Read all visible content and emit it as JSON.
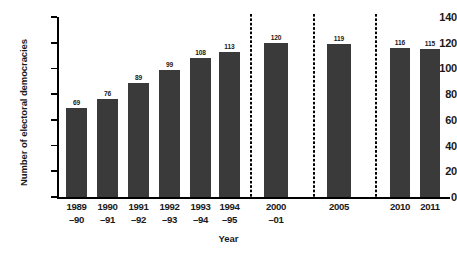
{
  "chart_data": {
    "type": "bar",
    "title": "",
    "xlabel": "Year",
    "ylabel": "Number of electoral democracies",
    "ylim": [
      0,
      140
    ],
    "ytick_step": 20,
    "yticks": [
      0,
      20,
      40,
      60,
      80,
      100,
      120,
      140
    ],
    "grid": false,
    "legend": false,
    "bar_color": "#3a3a3a",
    "axis_color": "#000000",
    "background_color": "#ffffff",
    "categories": [
      "1989–90",
      "1990–91",
      "1991–92",
      "1992–93",
      "1993–94",
      "1994–95",
      "2000–01",
      "2005",
      "2010",
      "2011"
    ],
    "category_lines": [
      [
        "1989",
        "–90"
      ],
      [
        "1990",
        "–91"
      ],
      [
        "1991",
        "–92"
      ],
      [
        "1992",
        "–93"
      ],
      [
        "1993",
        "–94"
      ],
      [
        "1994",
        "–95"
      ],
      [
        "2000",
        "–01"
      ],
      [
        "2005",
        ""
      ],
      [
        "2010",
        ""
      ],
      [
        "2011",
        ""
      ]
    ],
    "values": [
      69,
      76,
      89,
      99,
      108,
      113,
      120,
      119,
      116,
      115
    ],
    "annotations": {
      "axis_breaks": 3,
      "axis_break_style": "dotted vertical line",
      "axis_break_after_categories": [
        "1994–95",
        "2000–01",
        "2005"
      ]
    }
  }
}
